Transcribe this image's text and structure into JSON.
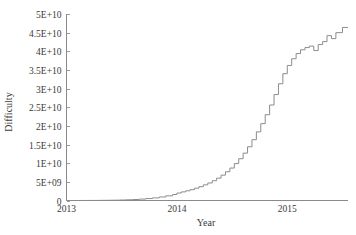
{
  "chart_data": {
    "type": "line",
    "title": "",
    "xlabel": "Year",
    "ylabel": "Difficulty",
    "grid": false,
    "legend": false,
    "line_color": "#8c8c8c",
    "text_color": "#3a3a3a",
    "background": "#ffffff",
    "xlim": [
      2013.0,
      2015.55
    ],
    "ylim": [
      0,
      50000000000
    ],
    "xticks": [
      2013,
      2014,
      2015
    ],
    "xtick_labels": [
      "2013",
      "2014",
      "2015"
    ],
    "yticks": [
      0,
      5000000000,
      10000000000,
      15000000000,
      20000000000,
      25000000000,
      30000000000,
      35000000000,
      40000000000,
      45000000000,
      50000000000
    ],
    "ytick_labels": [
      "0",
      "5E+09",
      "1E+10",
      "1.5E+10",
      "2E+10",
      "2.5E+10",
      "3E+10",
      "3.5E+10",
      "4E+10",
      "4.5E+10",
      "5E+10"
    ],
    "step_style": "post",
    "x": [
      2013.0,
      2013.06,
      2013.12,
      2013.18,
      2013.24,
      2013.3,
      2013.36,
      2013.42,
      2013.48,
      2013.54,
      2013.6,
      2013.66,
      2013.72,
      2013.78,
      2013.84,
      2013.9,
      2013.96,
      2014.0,
      2014.04,
      2014.08,
      2014.12,
      2014.16,
      2014.2,
      2014.24,
      2014.28,
      2014.32,
      2014.36,
      2014.4,
      2014.44,
      2014.48,
      2014.52,
      2014.56,
      2014.6,
      2014.64,
      2014.68,
      2014.72,
      2014.76,
      2014.8,
      2014.84,
      2014.88,
      2014.92,
      2014.96,
      2015.0,
      2015.04,
      2015.08,
      2015.12,
      2015.16,
      2015.2,
      2015.24,
      2015.28,
      2015.32,
      2015.36,
      2015.4,
      2015.44,
      2015.5
    ],
    "y": [
      1500000,
      4000000,
      8000000,
      15000000,
      25000000,
      40000000,
      60000000,
      90000000,
      130000000,
      190000000,
      270000000,
      380000000,
      520000000,
      700000000,
      950000000,
      1250000000,
      1600000000,
      2000000000,
      2300000000,
      2600000000,
      2900000000,
      3300000000,
      3700000000,
      4200000000,
      4700000000,
      5300000000,
      6000000000,
      6800000000,
      7700000000,
      8700000000,
      9900000000,
      11200000000,
      12700000000,
      14400000000,
      16300000000,
      18400000000,
      20600000000,
      23000000000,
      25600000000,
      28400000000,
      31300000000,
      34000000000,
      36200000000,
      38000000000,
      39400000000,
      40400000000,
      41000000000,
      41400000000,
      40200000000,
      41800000000,
      42600000000,
      44200000000,
      43400000000,
      45000000000,
      46400000000
    ]
  },
  "axes": {
    "y_title": "Difficulty",
    "x_title": "Year"
  }
}
